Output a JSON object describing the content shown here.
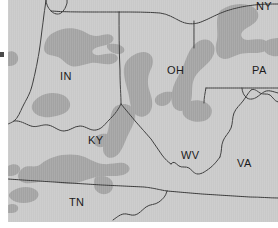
{
  "figure": {
    "kind": "choropleth-map",
    "width": 278,
    "height": 228,
    "background_color": "#ffffff",
    "map_background_color": "#c9c9c9",
    "shaded_region_color": "#a3a3a3",
    "boundary_line_color": "#3a3a3a",
    "label_color": "#1b1b1b",
    "plate": {
      "left": 8,
      "top": 0,
      "width": 270,
      "height": 222
    }
  },
  "axis": {
    "tick_mark": "left-edge-tick"
  },
  "map": {
    "title": "",
    "state_labels": [
      {
        "code": "IN",
        "x": 60,
        "y": 71
      },
      {
        "code": "OH",
        "x": 167,
        "y": 65
      },
      {
        "code": "PA",
        "x": 252,
        "y": 65
      },
      {
        "code": "NY",
        "x": 256,
        "y": 2
      },
      {
        "code": "KY",
        "x": 88,
        "y": 135
      },
      {
        "code": "WV",
        "x": 181,
        "y": 150
      },
      {
        "code": "VA",
        "x": 237,
        "y": 158
      },
      {
        "code": "TN",
        "x": 69,
        "y": 197
      }
    ],
    "legend": {
      "shaded_meaning": "highlighted region",
      "unshaded_meaning": "base region"
    }
  }
}
